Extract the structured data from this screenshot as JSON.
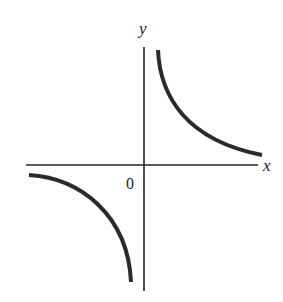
{
  "diagram": {
    "axes": {
      "x_label": "x",
      "y_label": "y",
      "origin_label": "0"
    },
    "curves": [
      {
        "name": "first-quadrant-branch",
        "quadrant": "I"
      },
      {
        "name": "third-quadrant-branch",
        "quadrant": "III"
      }
    ],
    "colors": {
      "stroke": "#2b2b2b",
      "background": "#ffffff"
    }
  }
}
